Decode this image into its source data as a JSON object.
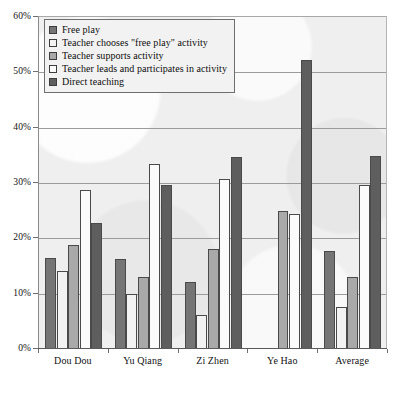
{
  "chart_data": {
    "type": "bar",
    "title": "",
    "subtitle": "",
    "xlabel": "",
    "ylabel": "",
    "ylim": [
      0,
      60
    ],
    "y_tick_labels": [
      "0%",
      "10%",
      "20%",
      "30%",
      "40%",
      "50%",
      "60%"
    ],
    "y_tick_values": [
      0,
      10,
      20,
      30,
      40,
      50,
      60
    ],
    "grid": true,
    "legend_position": "top-left",
    "categories": [
      "Dou Dou",
      "Yu Qiang",
      "Zi Zhen",
      "Ye Hao",
      "Average"
    ],
    "series": [
      {
        "name": "Free play",
        "swatch": "#757575",
        "values": [
          16.3,
          16.1,
          11.9,
          0,
          17.5
        ]
      },
      {
        "name": "Teacher chooses \"free play\" activity",
        "swatch": "#f2f2f2",
        "values": [
          13.9,
          9.7,
          6.0,
          0,
          7.5
        ]
      },
      {
        "name": "Teacher supports activity",
        "swatch": "#a9a9a9",
        "values": [
          18.7,
          12.8,
          17.9,
          24.8,
          12.8
        ]
      },
      {
        "name": "Teacher leads and participates in activity",
        "swatch": "#fbfbfb",
        "values": [
          28.6,
          33.2,
          30.5,
          24.3,
          29.4
        ]
      },
      {
        "name": "Direct teaching",
        "swatch": "#5e5e5e",
        "values": [
          22.6,
          29.4,
          34.5,
          52.0,
          34.7
        ]
      }
    ]
  },
  "colors": {
    "plot_background": "#efefef",
    "gridline": "#9b9b9b",
    "axis": "#5a5a5a",
    "bar_outline": "#4a4a4a",
    "text": "#111111"
  }
}
